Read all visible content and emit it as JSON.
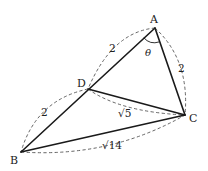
{
  "diagram": {
    "type": "geometry-triangle",
    "points": {
      "A": {
        "label": "A",
        "x": 155,
        "y": 28
      },
      "B": {
        "label": "B",
        "x": 21,
        "y": 152
      },
      "C": {
        "label": "C",
        "x": 185,
        "y": 115
      },
      "D": {
        "label": "D",
        "x": 88,
        "y": 89
      }
    },
    "segments": [
      {
        "from": "A",
        "to": "B",
        "style": "solid"
      },
      {
        "from": "A",
        "to": "C",
        "style": "solid"
      },
      {
        "from": "B",
        "to": "C",
        "style": "solid"
      },
      {
        "from": "D",
        "to": "C",
        "style": "solid"
      }
    ],
    "lengths": {
      "AD": "2",
      "DB": "2",
      "AC": "2",
      "DC": "√5",
      "BC": "√14"
    },
    "angle": {
      "vertex": "A",
      "label": "θ"
    }
  }
}
